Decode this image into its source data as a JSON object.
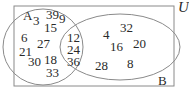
{
  "diagram": {
    "type": "venn",
    "universe_label": "U",
    "sets": [
      {
        "label": "A"
      },
      {
        "label": "B"
      }
    ],
    "regions": {
      "a_only": [
        "3",
        "39",
        "9",
        "15",
        "6",
        "27",
        "21",
        "30",
        "18",
        "33"
      ],
      "a_and_b": [
        "12",
        "24",
        "36"
      ],
      "b_only": [
        "4",
        "32",
        "16",
        "20",
        "28",
        "8"
      ]
    },
    "colors": {
      "lines": "#8a8a8a",
      "text": "#2a2a2a"
    }
  }
}
